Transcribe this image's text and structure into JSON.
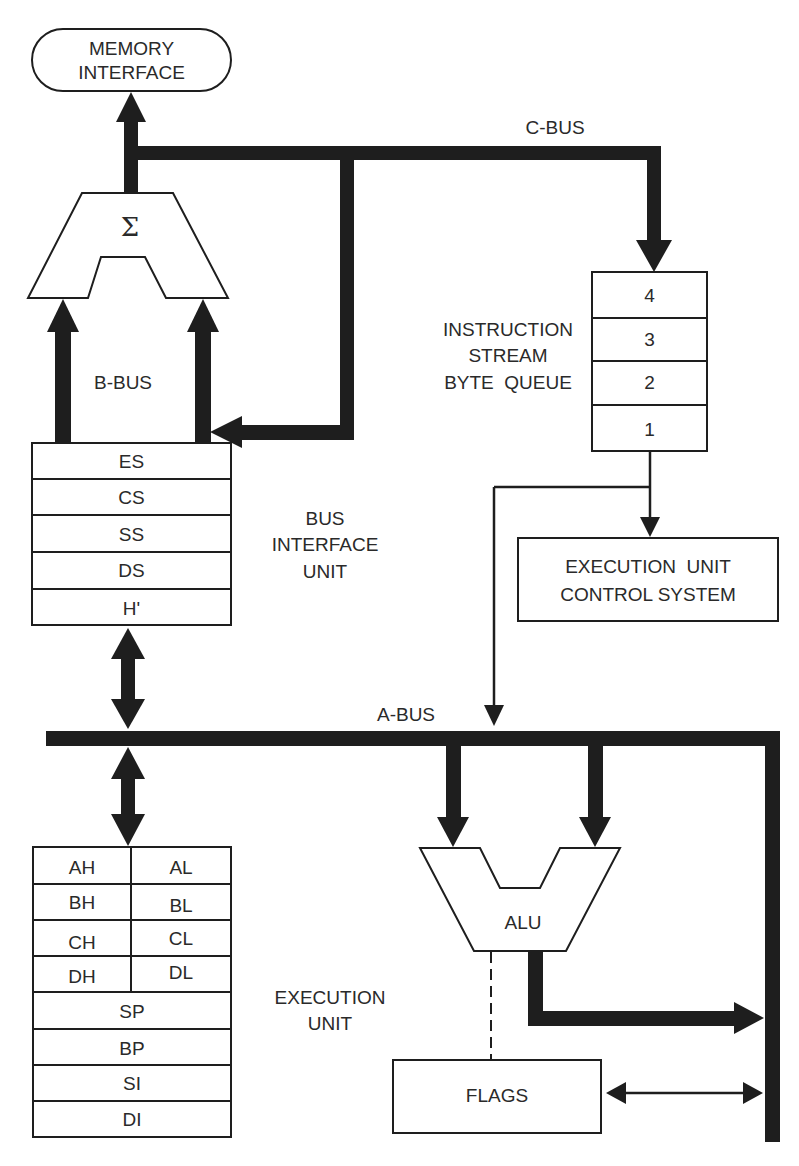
{
  "diagram": {
    "type": "cpu-architecture-block-diagram",
    "colors": {
      "ink": "#1e1e1e",
      "paper": "#ffffff",
      "text": "#2a2a2a"
    },
    "memory_interface": {
      "line1": "MEMORY",
      "line2": "INTERFACE"
    },
    "adder": {
      "symbol": "Σ"
    },
    "buses": {
      "c_bus": "C-BUS",
      "b_bus": "B-BUS",
      "a_bus": "A-BUS"
    },
    "instruction_queue": {
      "label": [
        "INSTRUCTION",
        "STREAM",
        "BYTE  QUEUE"
      ],
      "slots": [
        "4",
        "3",
        "2",
        "1"
      ]
    },
    "bus_interface_unit": {
      "label": [
        "BUS",
        "INTERFACE",
        "UNIT"
      ],
      "registers": [
        "ES",
        "CS",
        "SS",
        "DS",
        "H'"
      ]
    },
    "eu_control": {
      "line1": "EXECUTION  UNIT",
      "line2": "CONTROL SYSTEM"
    },
    "execution_unit": {
      "label": [
        "EXECUTION",
        "UNIT"
      ],
      "split_registers": [
        {
          "high": "AH",
          "low": "AL"
        },
        {
          "high": "BH",
          "low": "BL"
        },
        {
          "high": "CH",
          "low": "CL"
        },
        {
          "high": "DH",
          "low": "DL"
        }
      ],
      "registers": [
        "SP",
        "BP",
        "SI",
        "DI"
      ]
    },
    "alu": {
      "label": "ALU"
    },
    "flags": {
      "label": "FLAGS"
    }
  }
}
